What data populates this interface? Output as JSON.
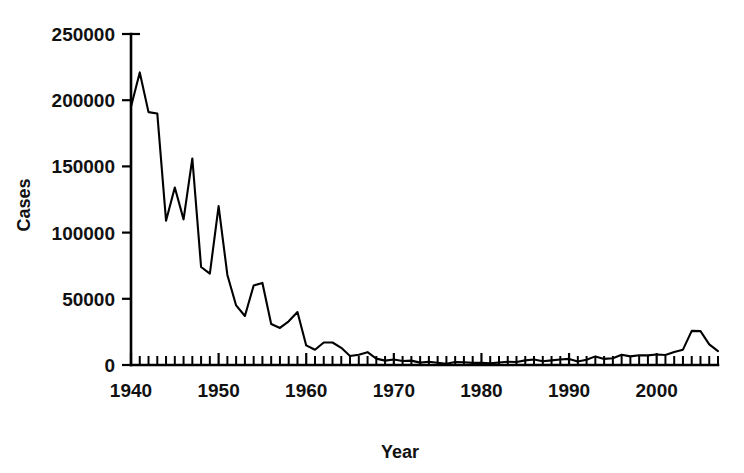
{
  "chart_data": {
    "type": "line",
    "title": "",
    "xlabel": "Year",
    "ylabel": "Cases",
    "xlim": [
      1940,
      2007
    ],
    "ylim": [
      0,
      250000
    ],
    "grid": false,
    "legend": null,
    "y_ticks": [
      0,
      50000,
      100000,
      150000,
      200000,
      250000
    ],
    "y_tick_labels": [
      "0",
      "50000",
      "100000",
      "150000",
      "200000",
      "250000"
    ],
    "x_ticks": [
      1940,
      1950,
      1960,
      1970,
      1980,
      1990,
      2000
    ],
    "x_tick_labels": [
      "1940",
      "1950",
      "1960",
      "1970",
      "1980",
      "1990",
      "2000"
    ],
    "x_minor_tick_interval": 1,
    "series": [
      {
        "name": "Cases",
        "color": "#000000",
        "x": [
          1940,
          1941,
          1942,
          1943,
          1944,
          1945,
          1946,
          1947,
          1948,
          1949,
          1950,
          1951,
          1952,
          1953,
          1954,
          1955,
          1956,
          1957,
          1958,
          1959,
          1960,
          1961,
          1962,
          1963,
          1964,
          1965,
          1966,
          1967,
          1968,
          1969,
          1970,
          1971,
          1972,
          1973,
          1974,
          1975,
          1976,
          1977,
          1978,
          1979,
          1980,
          1981,
          1982,
          1983,
          1984,
          1985,
          1986,
          1987,
          1988,
          1989,
          1990,
          1991,
          1992,
          1993,
          1994,
          1995,
          1996,
          1997,
          1998,
          1999,
          2000,
          2001,
          2002,
          2003,
          2004,
          2005,
          2006,
          2007
        ],
        "values": [
          195000,
          221000,
          191000,
          190000,
          109000,
          134000,
          110000,
          156000,
          74000,
          69000,
          120000,
          68000,
          45000,
          37000,
          60000,
          62000,
          31000,
          28000,
          33000,
          40000,
          14800,
          11500,
          17000,
          17000,
          13000,
          6800,
          7700,
          9700,
          4800,
          3300,
          4200,
          3000,
          3300,
          1800,
          2400,
          1700,
          1000,
          2200,
          2100,
          1600,
          1700,
          1200,
          1900,
          2500,
          2300,
          3500,
          4200,
          2800,
          3500,
          4200,
          4600,
          2700,
          4000,
          6500,
          4600,
          5100,
          7800,
          6500,
          7400,
          7300,
          7900,
          7600,
          9800,
          11600,
          25800,
          25600,
          15600,
          10500
        ]
      }
    ]
  },
  "axes": {
    "y_title": "Cases",
    "x_title": "Year"
  }
}
